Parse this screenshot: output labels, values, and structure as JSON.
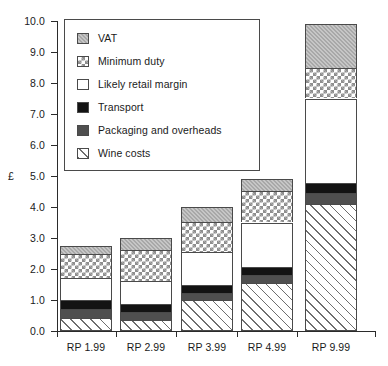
{
  "chart_data": {
    "type": "bar",
    "stacked": true,
    "title": "",
    "xlabel": "",
    "ylabel": "£",
    "ylim": [
      0.0,
      10.0
    ],
    "ytick_step": 1.0,
    "grid": false,
    "legend_position": "top-left-inside",
    "categories": [
      "RP 1.99",
      "RP 2.99",
      "RP 3.99",
      "RP 4.99",
      "RP 9.99"
    ],
    "ytick_labels": [
      "0.0",
      "1.0",
      "2.0",
      "3.0",
      "4.0",
      "5.0",
      "6.0",
      "7.0",
      "8.0",
      "9.0",
      "10.0"
    ],
    "series": [
      {
        "name": "Wine costs",
        "color": "#fcfcfc",
        "pattern": "diagonal-hatch",
        "values": [
          0.42,
          0.35,
          1.0,
          1.55,
          4.1
        ]
      },
      {
        "name": "Packaging and overheads",
        "color": "#4f4f4f",
        "pattern": "solid-dark-grey",
        "values": [
          0.29,
          0.25,
          0.23,
          0.25,
          0.35
        ]
      },
      {
        "name": "Transport",
        "color": "#131313",
        "pattern": "solid-black",
        "values": [
          0.29,
          0.27,
          0.26,
          0.26,
          0.32
        ]
      },
      {
        "name": "Likely retail margin",
        "color": "#ffffff",
        "pattern": "blank",
        "values": [
          0.71,
          0.73,
          1.07,
          1.44,
          2.73
        ]
      },
      {
        "name": "Minimum duty",
        "color": "#ffffff",
        "pattern": "cross-checker-hatch",
        "values": [
          0.77,
          1.0,
          0.95,
          1.0,
          0.98
        ]
      },
      {
        "name": "VAT",
        "color": "#a8a8a8",
        "pattern": "grey-speckle",
        "values": [
          0.26,
          0.4,
          0.49,
          0.4,
          1.42
        ]
      }
    ],
    "totals": [
      2.0,
      3.0,
      4.0,
      4.9,
      9.9
    ]
  },
  "legend": {
    "items": [
      {
        "label": "VAT"
      },
      {
        "label": "Minimum duty"
      },
      {
        "label": "Likely retail margin"
      },
      {
        "label": "Transport"
      },
      {
        "label": "Packaging and overheads"
      },
      {
        "label": "Wine costs"
      }
    ]
  }
}
